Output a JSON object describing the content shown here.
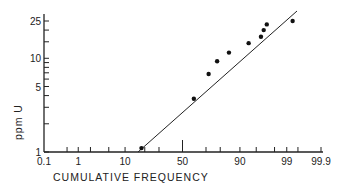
{
  "chart_data": {
    "type": "scatter",
    "title": "",
    "xlabel": "CUMULATIVE FREQUENCY",
    "ylabel": "ppm U",
    "x_scale": "probability",
    "y_scale": "log",
    "xlim": [
      0.1,
      99.9
    ],
    "ylim": [
      1,
      30
    ],
    "x_ticks": [
      "0.1",
      "1",
      "10",
      "50",
      "90",
      "99",
      "99.9"
    ],
    "y_ticks": [
      "1",
      "5",
      "10",
      "25"
    ],
    "grid": false,
    "legend": null,
    "series": [
      {
        "name": "samples",
        "points": [
          {
            "x": 18,
            "y": 1.1
          },
          {
            "x": 60,
            "y": 3.7
          },
          {
            "x": 72,
            "y": 6.8
          },
          {
            "x": 78,
            "y": 9.3
          },
          {
            "x": 85,
            "y": 11.5
          },
          {
            "x": 93,
            "y": 14.5
          },
          {
            "x": 96,
            "y": 17
          },
          {
            "x": 96.5,
            "y": 20
          },
          {
            "x": 97,
            "y": 23
          },
          {
            "x": 99.3,
            "y": 25
          }
        ]
      },
      {
        "name": "fit line",
        "type": "line",
        "points": [
          {
            "x": 15,
            "y": 1.0
          },
          {
            "x": 99,
            "y": 28
          }
        ]
      }
    ]
  }
}
